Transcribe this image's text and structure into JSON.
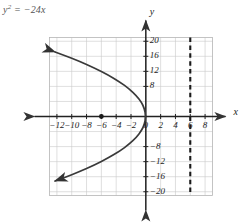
{
  "figure": {
    "equation_label": "y",
    "equation_sup": "2",
    "equation_rest": " = −24x",
    "x_axis_name": "x",
    "y_axis_name": "y"
  },
  "chart_data": {
    "type": "line",
    "xlabel": "x",
    "ylabel": "y",
    "xlim": [
      -13,
      9
    ],
    "ylim": [
      -21,
      21
    ],
    "grid": true,
    "grid_step_x": 2,
    "grid_step_y": 4,
    "legend": "none",
    "x_ticks": [
      -12,
      -10,
      -8,
      -6,
      -4,
      -2,
      0,
      2,
      4,
      6,
      8
    ],
    "x_tick_labels": [
      "−12",
      "−10",
      "−8",
      "−6",
      "−4",
      "−2",
      "0",
      "2",
      "4",
      "6",
      "8"
    ],
    "y_ticks": [
      -20,
      -16,
      -12,
      -8,
      8,
      12,
      16,
      20
    ],
    "y_tick_labels": [
      "−20",
      "−16",
      "−12",
      "−8",
      "8",
      "12",
      "16",
      "20"
    ],
    "series": [
      {
        "name": "parabola y² = −24x",
        "equation": "y^2 = -24x",
        "opens": "left",
        "vertex": [
          0,
          0
        ],
        "style": "solid",
        "arrowheads": [
          "start",
          "end"
        ],
        "points": [
          [
            -12.25,
            17.15
          ],
          [
            -11.0,
            16.25
          ],
          [
            -9.0,
            14.7
          ],
          [
            -7.0,
            12.96
          ],
          [
            -5.0,
            10.95
          ],
          [
            -3.5,
            9.17
          ],
          [
            -2.25,
            7.35
          ],
          [
            -1.25,
            5.48
          ],
          [
            -0.6,
            3.79
          ],
          [
            -0.2,
            2.19
          ],
          [
            0,
            0
          ],
          [
            -0.2,
            -2.19
          ],
          [
            -0.6,
            -3.79
          ],
          [
            -1.25,
            -5.48
          ],
          [
            -2.25,
            -7.35
          ],
          [
            -3.5,
            -9.17
          ],
          [
            -5.0,
            -10.95
          ],
          [
            -7.0,
            -12.96
          ],
          [
            -9.0,
            -14.7
          ],
          [
            -11.0,
            -16.25
          ],
          [
            -12.25,
            -17.15
          ]
        ]
      },
      {
        "name": "directrix",
        "type": "vertical-line",
        "style": "dashed",
        "x": 6
      }
    ],
    "points": [
      {
        "name": "focus",
        "coords": [
          -6,
          0
        ],
        "marker": "filled-circle"
      }
    ]
  }
}
